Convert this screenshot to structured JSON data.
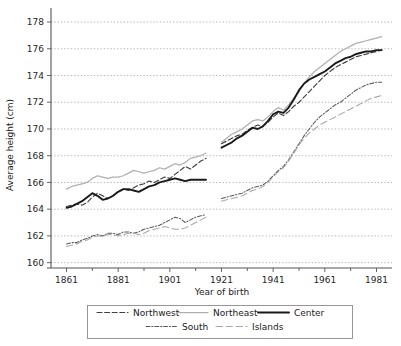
{
  "chart_data": {
    "type": "line",
    "title": "",
    "xlabel": "Year of birth",
    "ylabel": "Average height (cm)",
    "xlim": [
      1855,
      1987
    ],
    "ylim": [
      159.6,
      178.6
    ],
    "xticks": [
      1861,
      1881,
      1901,
      1921,
      1941,
      1961,
      1981
    ],
    "yticks": [
      160,
      162,
      164,
      166,
      168,
      170,
      172,
      174,
      176,
      178
    ],
    "grid": true,
    "legend_position": "bottom",
    "minor_xticks": [
      1871,
      1891,
      1911,
      1931,
      1951,
      1971
    ],
    "series": [
      {
        "name": "Northwest",
        "style": "dashed",
        "color": "#404040",
        "x": [
          1861,
          1863,
          1865,
          1867,
          1869,
          1871,
          1873,
          1875,
          1877,
          1879,
          1881,
          1883,
          1885,
          1887,
          1889,
          1891,
          1893,
          1895,
          1897,
          1899,
          1901,
          1903,
          1905,
          1907,
          1909,
          1911,
          1913,
          1915
        ],
        "y": [
          164.2,
          164.3,
          164.4,
          164.3,
          164.5,
          164.9,
          165.2,
          165.0,
          164.8,
          165.0,
          165.3,
          165.5,
          165.4,
          165.6,
          165.8,
          165.9,
          166.1,
          166.0,
          166.2,
          166.4,
          166.3,
          166.6,
          166.9,
          167.2,
          167.0,
          167.3,
          167.6,
          167.8
        ],
        "x2": [
          1921,
          1923,
          1925,
          1927,
          1929,
          1931,
          1933,
          1935,
          1937,
          1939,
          1941,
          1943,
          1945,
          1947,
          1949,
          1951,
          1953,
          1955,
          1957,
          1959,
          1961,
          1963,
          1965,
          1967,
          1969,
          1971,
          1973,
          1975,
          1977,
          1979,
          1981,
          1983
        ],
        "y2": [
          168.9,
          169.1,
          169.3,
          169.5,
          169.6,
          169.9,
          170.1,
          170.3,
          170.2,
          170.5,
          170.9,
          171.2,
          171.0,
          171.3,
          171.7,
          172.0,
          172.4,
          172.8,
          173.2,
          173.6,
          174.0,
          174.3,
          174.6,
          174.8,
          175.0,
          175.2,
          175.4,
          175.5,
          175.6,
          175.7,
          175.8,
          175.9
        ]
      },
      {
        "name": "Northeast",
        "style": "solid",
        "color": "#b0b0b0",
        "x": [
          1861,
          1863,
          1865,
          1867,
          1869,
          1871,
          1873,
          1875,
          1877,
          1879,
          1881,
          1883,
          1885,
          1887,
          1889,
          1891,
          1893,
          1895,
          1897,
          1899,
          1901,
          1903,
          1905,
          1907,
          1909,
          1911,
          1913,
          1915
        ],
        "y": [
          165.5,
          165.7,
          165.8,
          165.9,
          166.0,
          166.3,
          166.5,
          166.4,
          166.3,
          166.4,
          166.4,
          166.5,
          166.7,
          166.9,
          166.8,
          166.7,
          166.8,
          166.9,
          167.1,
          167.0,
          167.2,
          167.4,
          167.3,
          167.5,
          167.8,
          167.9,
          168.0,
          168.2
        ],
        "x2": [
          1921,
          1923,
          1925,
          1927,
          1929,
          1931,
          1933,
          1935,
          1937,
          1939,
          1941,
          1943,
          1945,
          1947,
          1949,
          1951,
          1953,
          1955,
          1957,
          1959,
          1961,
          1963,
          1965,
          1967,
          1969,
          1971,
          1973,
          1975,
          1977,
          1979,
          1981,
          1983
        ],
        "y2": [
          169.0,
          169.3,
          169.6,
          169.8,
          170.0,
          170.3,
          170.6,
          170.7,
          170.6,
          170.9,
          171.3,
          171.6,
          171.4,
          171.8,
          172.3,
          172.8,
          173.4,
          173.9,
          174.3,
          174.6,
          174.9,
          175.2,
          175.5,
          175.8,
          176.0,
          176.2,
          176.4,
          176.5,
          176.6,
          176.7,
          176.8,
          176.9
        ]
      },
      {
        "name": "Center",
        "style": "solid-bold",
        "color": "#1a1a1a",
        "x": [
          1861,
          1863,
          1865,
          1867,
          1869,
          1871,
          1873,
          1875,
          1877,
          1879,
          1881,
          1883,
          1885,
          1887,
          1889,
          1891,
          1893,
          1895,
          1897,
          1899,
          1901,
          1903,
          1905,
          1907,
          1909,
          1911,
          1913,
          1915
        ],
        "y": [
          164.1,
          164.2,
          164.4,
          164.6,
          164.9,
          165.2,
          165.0,
          164.7,
          164.8,
          165.0,
          165.3,
          165.5,
          165.5,
          165.4,
          165.3,
          165.5,
          165.7,
          165.8,
          166.0,
          166.1,
          166.2,
          166.3,
          166.2,
          166.1,
          166.2,
          166.2,
          166.2,
          166.2
        ],
        "x2": [
          1921,
          1923,
          1925,
          1927,
          1929,
          1931,
          1933,
          1935,
          1937,
          1939,
          1941,
          1943,
          1945,
          1947,
          1949,
          1951,
          1953,
          1955,
          1957,
          1959,
          1961,
          1963,
          1965,
          1967,
          1969,
          1971,
          1973,
          1975,
          1977,
          1979,
          1981,
          1983
        ],
        "y2": [
          168.6,
          168.8,
          169.0,
          169.3,
          169.5,
          169.8,
          170.1,
          170.0,
          170.2,
          170.6,
          171.1,
          171.3,
          171.2,
          171.6,
          172.2,
          172.9,
          173.4,
          173.7,
          173.9,
          174.1,
          174.3,
          174.6,
          174.9,
          175.1,
          175.3,
          175.4,
          175.6,
          175.7,
          175.8,
          175.8,
          175.9,
          175.9
        ]
      },
      {
        "name": "South",
        "style": "dash-dot",
        "color": "#595959",
        "x": [
          1861,
          1863,
          1865,
          1867,
          1869,
          1871,
          1873,
          1875,
          1877,
          1879,
          1881,
          1883,
          1885,
          1887,
          1889,
          1891,
          1893,
          1895,
          1897,
          1899,
          1901,
          1903,
          1905,
          1907,
          1909,
          1911,
          1913,
          1915
        ],
        "y": [
          161.4,
          161.5,
          161.5,
          161.7,
          161.8,
          162.0,
          162.1,
          162.0,
          162.2,
          162.2,
          162.1,
          162.3,
          162.3,
          162.2,
          162.3,
          162.5,
          162.6,
          162.7,
          162.8,
          163.0,
          163.2,
          163.4,
          163.3,
          163.0,
          163.2,
          163.4,
          163.5,
          163.6
        ],
        "x2": [
          1921,
          1923,
          1925,
          1927,
          1929,
          1931,
          1933,
          1935,
          1937,
          1939,
          1941,
          1943,
          1945,
          1947,
          1949,
          1951,
          1953,
          1955,
          1957,
          1959,
          1961,
          1963,
          1965,
          1967,
          1969,
          1971,
          1973,
          1975,
          1977,
          1979,
          1981,
          1983
        ],
        "y2": [
          164.8,
          164.9,
          165.0,
          165.1,
          165.2,
          165.4,
          165.6,
          165.7,
          165.8,
          166.1,
          166.5,
          166.9,
          167.2,
          167.7,
          168.3,
          168.9,
          169.5,
          170.0,
          170.5,
          170.9,
          171.2,
          171.5,
          171.8,
          172.0,
          172.3,
          172.6,
          172.9,
          173.1,
          173.3,
          173.4,
          173.5,
          173.5
        ]
      },
      {
        "name": "Islands",
        "style": "long-dash",
        "color": "#a8a8a8",
        "x": [
          1861,
          1863,
          1865,
          1867,
          1869,
          1871,
          1873,
          1875,
          1877,
          1879,
          1881,
          1883,
          1885,
          1887,
          1889,
          1891,
          1893,
          1895,
          1897,
          1899,
          1901,
          1903,
          1905,
          1907,
          1909,
          1911,
          1913,
          1915
        ],
        "y": [
          161.2,
          161.3,
          161.4,
          161.6,
          161.7,
          161.9,
          162.0,
          162.0,
          162.1,
          162.1,
          162.0,
          162.1,
          162.2,
          162.2,
          162.1,
          162.2,
          162.4,
          162.5,
          162.6,
          162.7,
          162.6,
          162.5,
          162.5,
          162.6,
          162.8,
          163.0,
          163.2,
          163.4
        ],
        "x2": [
          1921,
          1923,
          1925,
          1927,
          1929,
          1931,
          1933,
          1935,
          1937,
          1939,
          1941,
          1943,
          1945,
          1947,
          1949,
          1951,
          1953,
          1955,
          1957,
          1959,
          1961,
          1963,
          1965,
          1967,
          1969,
          1971,
          1973,
          1975,
          1977,
          1979,
          1981,
          1983
        ],
        "y2": [
          164.6,
          164.7,
          164.8,
          164.9,
          165.0,
          165.2,
          165.4,
          165.5,
          165.7,
          166.0,
          166.4,
          166.8,
          167.1,
          167.6,
          168.2,
          168.8,
          169.3,
          169.7,
          170.0,
          170.3,
          170.5,
          170.7,
          170.9,
          171.1,
          171.3,
          171.5,
          171.7,
          171.9,
          172.1,
          172.3,
          172.4,
          172.5
        ]
      }
    ]
  },
  "legend": {
    "entries": [
      {
        "label": "Northwest"
      },
      {
        "label": "Northeast"
      },
      {
        "label": "Center"
      },
      {
        "label": "South"
      },
      {
        "label": "Islands"
      }
    ]
  }
}
